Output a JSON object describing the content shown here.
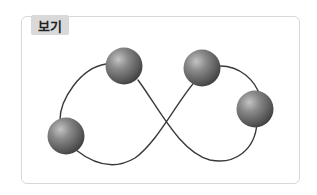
{
  "box": {
    "label": "보기"
  },
  "diagram": {
    "sphere_count": 4,
    "colors": {
      "curve": "#3a3a3a",
      "sphere_light": "#b0b0b0",
      "sphere_mid": "#7a7a7a",
      "sphere_dark": "#3c3c3c",
      "frame_border": "#d8d8d8",
      "label_bg": "#d9d9d9"
    }
  }
}
